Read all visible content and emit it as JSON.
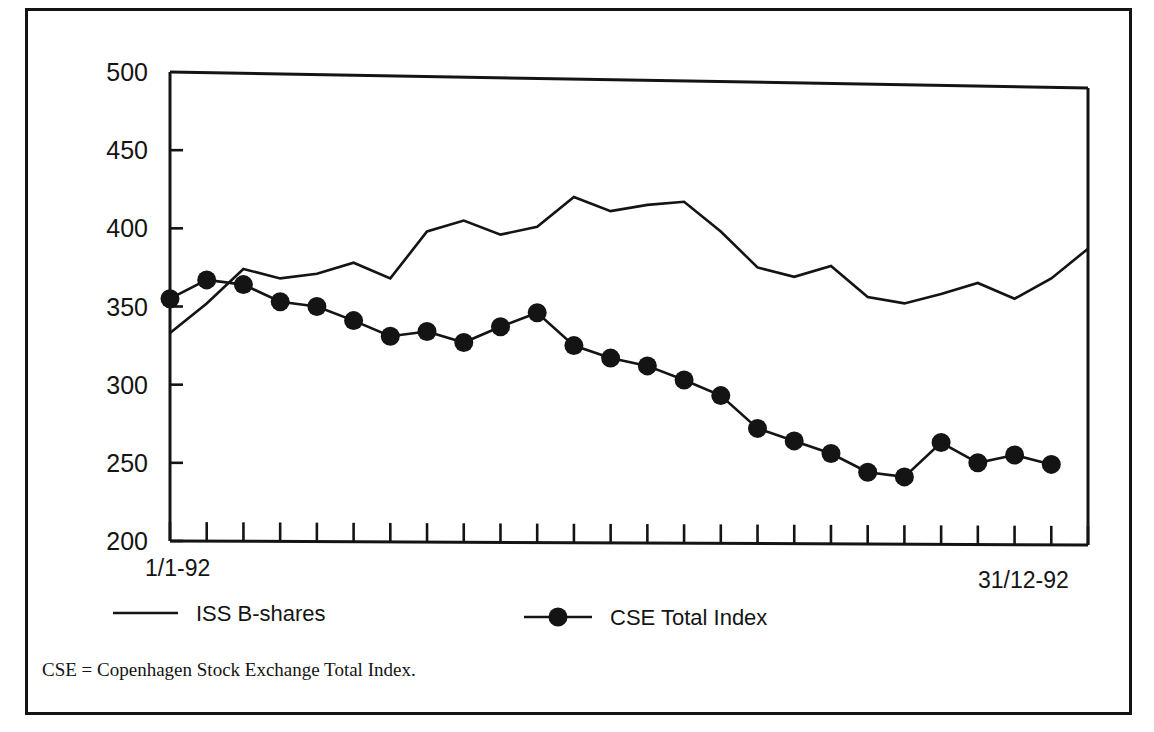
{
  "chart_data": {
    "type": "line",
    "title": "",
    "subtitle": "",
    "xlabel": "",
    "ylabel": "",
    "ylim": [
      200,
      500
    ],
    "yticks": [
      200,
      250,
      300,
      350,
      400,
      450,
      500
    ],
    "ytick_labels": [
      "200",
      "250",
      "300",
      "350",
      "400",
      "450",
      "500"
    ],
    "xtick_labels_shown": [
      "1/1-92",
      "31/12-92"
    ],
    "x_start_label": "1/1-92",
    "x_end_label": "31/12-92",
    "n_xticks": 26,
    "grid": false,
    "legend_position": "below-plot",
    "note": "CSE = Copenhagen Stock Exchange Total Index.",
    "series": [
      {
        "name": "ISS B-shares",
        "marker": "none",
        "color": "#141414",
        "values": [
          333,
          352,
          374,
          368,
          371,
          378,
          368,
          398,
          405,
          396,
          401,
          420,
          411,
          415,
          417,
          398,
          375,
          369,
          376,
          356,
          352,
          358,
          365,
          355,
          368,
          387
        ]
      },
      {
        "name": "CSE Total Index",
        "marker": "filled-circle",
        "color": "#141414",
        "values": [
          355,
          367,
          364,
          353,
          350,
          341,
          331,
          334,
          327,
          337,
          346,
          325,
          317,
          312,
          303,
          293,
          272,
          264,
          256,
          244,
          241,
          263,
          250,
          255,
          249
        ]
      }
    ]
  },
  "legend": {
    "items": [
      {
        "label": "ISS B-shares",
        "marker": "none"
      },
      {
        "label": "CSE Total Index",
        "marker": "filled-circle"
      }
    ]
  },
  "footnote": {
    "text": "CSE = Copenhagen Stock Exchange Total Index."
  }
}
